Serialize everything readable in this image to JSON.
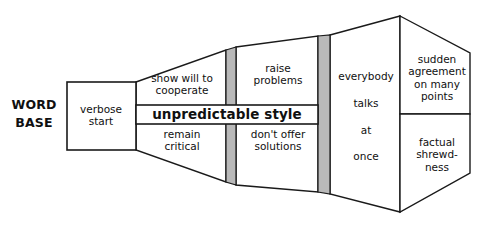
{
  "diagram": {
    "colors": {
      "stroke": "#1a1a1a",
      "fill": "#ffffff",
      "bar_gray": "#b9b9b9",
      "text": "#101010"
    },
    "root_label": "WORD\nBASE",
    "stages": [
      {
        "id": "verbose-start",
        "label": "verbose\nstart",
        "shape": "rectangle"
      },
      {
        "id": "stage-1-upper",
        "label": "show will to\ncooperate",
        "shape": "trapezoid-upper"
      },
      {
        "id": "stage-1-lower",
        "label": "remain\ncritical",
        "shape": "trapezoid-lower"
      },
      {
        "id": "stage-2-upper",
        "label": "raise\nproblems",
        "shape": "trapezoid-upper"
      },
      {
        "id": "stage-2-lower",
        "label": "don't offer\nsolutions",
        "shape": "trapezoid-lower"
      },
      {
        "id": "stage-3",
        "label": "everybody\ntalks\nat\nonce",
        "shape": "trapezoid-full"
      },
      {
        "id": "stage-4-upper",
        "label": "sudden\nagreement\non many\npoints",
        "shape": "hexagon-upper"
      },
      {
        "id": "stage-4-lower",
        "label": "factual\nshrewd-\nness",
        "shape": "hexagon-lower"
      }
    ],
    "banner": {
      "id": "unpredictable-style",
      "label": "unpredictable style",
      "emphasis": "bold"
    },
    "dividers": [
      {
        "id": "gray-bar-1",
        "color": "#b9b9b9"
      },
      {
        "id": "gray-bar-2",
        "color": "#b9b9b9"
      }
    ]
  }
}
